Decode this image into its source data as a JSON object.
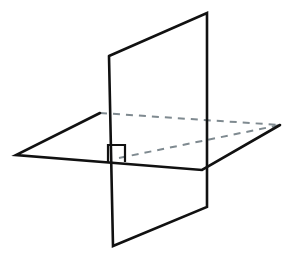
{
  "figure": {
    "background_color": "#ffffff",
    "solid_line_color": "#111111",
    "hidden_line_color": "#7f8a90",
    "solid_line_width": 2.6,
    "hidden_line_width": 2.0,
    "hidden_line_dash": "7 6"
  },
  "canvas": {
    "width": 300,
    "height": 262
  },
  "shapes": {
    "vertical_plane": {
      "name": "vertical-plane",
      "label": "Vertical plane",
      "points": "109,56 207,13 207,207 113,246",
      "visible_outline": "109,56 207,13 207,207 113,246 109,56"
    },
    "horizontal_plane": {
      "name": "horizontal-plane",
      "label": "Horizontal plane",
      "points": "100,113 280,125 202,170 16,155",
      "front_edges": "100,113 16,155 202,170 280,125",
      "back_left_vertex": "100,113",
      "right_vertex": "280,125",
      "front_vertex": "202,170",
      "left_vertex": "16,155"
    },
    "hidden_edges": {
      "name": "hidden-edges",
      "label": "Hidden edges",
      "back_edge": "100,113 280,125",
      "intersection_diagonal": "119,158 280,125",
      "vertical_hidden": "207,122 207,170"
    },
    "right_angle_marker": {
      "name": "right-angle-marker",
      "label": "Right angle marker",
      "path": "M 108,162 L 108,145 L 125,145 L 125,162"
    },
    "intersection_line": {
      "name": "intersection-line",
      "label": "Plane intersection segment",
      "path": "107,113 107,246"
    }
  }
}
